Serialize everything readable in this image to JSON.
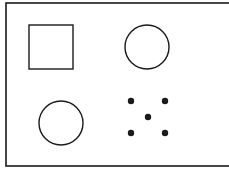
{
  "figure": {
    "background": "#ffffff",
    "stroke_color": "#1a1a1a",
    "frame": {
      "x": 6,
      "y": 3,
      "width": 240,
      "height": 163
    },
    "shapes": [
      {
        "type": "square",
        "x": 29,
        "y": 25,
        "width": 44,
        "height": 44
      },
      {
        "type": "circle",
        "cx": 147,
        "cy": 47,
        "r": 22
      },
      {
        "type": "circle",
        "cx": 61,
        "cy": 123,
        "r": 22
      },
      {
        "type": "dot-cluster",
        "dots": [
          {
            "cx": 131,
            "cy": 101,
            "r": 3.2
          },
          {
            "cx": 165,
            "cy": 101,
            "r": 3.2
          },
          {
            "cx": 148,
            "cy": 117,
            "r": 3.2
          },
          {
            "cx": 131,
            "cy": 133,
            "r": 3.2
          },
          {
            "cx": 165,
            "cy": 133,
            "r": 3.2
          }
        ]
      }
    ]
  }
}
